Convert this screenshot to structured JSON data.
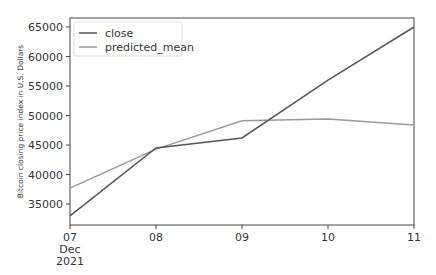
{
  "chart_data": {
    "type": "line",
    "title": "",
    "xlabel": "",
    "ylabel": "Bitcoin closing price index in U.S. Dollars",
    "categories": [
      "07",
      "08",
      "09",
      "10",
      "11"
    ],
    "x_sublabels": [
      "Dec",
      "2021"
    ],
    "series": [
      {
        "name": "close",
        "color": "#555555",
        "values": [
          33000,
          44500,
          46200,
          56000,
          65000
        ]
      },
      {
        "name": "predicted_mean",
        "color": "#999999",
        "values": [
          37700,
          44300,
          49100,
          49400,
          48400
        ]
      }
    ],
    "yticks": [
      35000,
      40000,
      45000,
      50000,
      55000,
      60000,
      65000
    ],
    "ylim": [
      31500,
      66500
    ],
    "legend_position": "upper left",
    "grid": false
  }
}
